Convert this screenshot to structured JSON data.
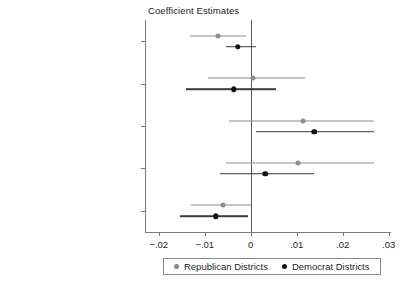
{
  "chart_data": {
    "type": "scatter",
    "title": "Coefficient Estimates",
    "xlabel": "",
    "ylabel": "",
    "xlim": [
      -0.023,
      0.0305
    ],
    "xticks": [
      -0.02,
      -0.01,
      0,
      0.01,
      0.02,
      0.03
    ],
    "xticklabels": [
      "−.02",
      "−.01",
      "0",
      ".01",
      ".02",
      ".03"
    ],
    "grid": false,
    "zero_reference_line": 0,
    "legend_position": "bottom",
    "categories": [
      "Percent Black Board",
      "Percent Black Administrators",
      "Percent Black Teachers",
      "Percent Black Students",
      "Percent District Democrat"
    ],
    "series": [
      {
        "name": "Republican Districts",
        "color": "#8c8c8c",
        "points": [
          {
            "category": "Percent Black Board",
            "estimate": -0.0071,
            "ci_low": -0.0133,
            "ci_high": -0.0011
          },
          {
            "category": "Percent Black Administrators",
            "estimate": 0.0005,
            "ci_low": -0.0093,
            "ci_high": 0.0118
          },
          {
            "category": "Percent Black Teachers",
            "estimate": 0.0114,
            "ci_low": -0.0047,
            "ci_high": 0.0269
          },
          {
            "category": "Percent Black Students",
            "estimate": 0.0103,
            "ci_low": -0.0054,
            "ci_high": 0.0269
          },
          {
            "category": "Percent District Democrat",
            "estimate": -0.006,
            "ci_low": -0.0131,
            "ci_high": 0.0
          }
        ]
      },
      {
        "name": "Democrat Districts",
        "color": "#111111",
        "points": [
          {
            "category": "Percent Black Board",
            "estimate": -0.0028,
            "ci_low": -0.0054,
            "ci_high": 0.0011
          },
          {
            "category": "Percent Black Administrators",
            "estimate": -0.0037,
            "ci_low": -0.014,
            "ci_high": 0.0054
          },
          {
            "category": "Percent Black Teachers",
            "estimate": 0.0138,
            "ci_low": 0.0011,
            "ci_high": 0.0269
          },
          {
            "category": "Percent Black Students",
            "estimate": 0.0032,
            "ci_low": -0.0067,
            "ci_high": 0.0138
          },
          {
            "category": "Percent District Democrat",
            "estimate": -0.0076,
            "ci_low": -0.0153,
            "ci_high": -0.0007
          }
        ]
      }
    ]
  },
  "legend": {
    "items": [
      {
        "label": "Republican Districts",
        "marker": "circle-gray"
      },
      {
        "label": "Democrat Districts",
        "marker": "circle-black"
      }
    ]
  }
}
